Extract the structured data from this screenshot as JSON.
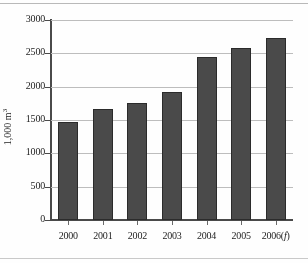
{
  "chart_data": {
    "type": "bar",
    "title": "",
    "xlabel": "",
    "ylabel": "1,000 m",
    "ylabel_sup": "3",
    "categories": [
      "2000",
      "2001",
      "2002",
      "2003",
      "2004",
      "2005",
      "2006(f)"
    ],
    "values": [
      1470,
      1665,
      1755,
      1915,
      2445,
      2580,
      2730
    ],
    "ylim": [
      0,
      3000
    ],
    "ytick_labels": [
      "0",
      "500",
      "1000",
      "1500",
      "2000",
      "2500",
      "3000"
    ],
    "ytick_values": [
      0,
      500,
      1000,
      1500,
      2000,
      2500,
      3000
    ],
    "grid": true,
    "legend": "none",
    "series_color": "#4a4a4a",
    "grid_color": "#bdbdbd",
    "axis_color": "#4a4a4a"
  },
  "last_category": {
    "year": "2006",
    "forecast_marker": "f"
  }
}
